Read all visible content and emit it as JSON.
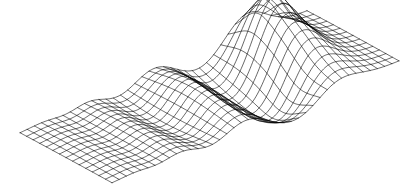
{
  "figure": {
    "title": "",
    "background_color": "#ffffff",
    "width": 417,
    "height": 194
  },
  "chart_data": {
    "type": "surface",
    "render_style": "wireframe-mesh",
    "title": "",
    "subtitle": "",
    "xlabel": "",
    "ylabel": "",
    "zlabel": "",
    "legend": [],
    "annotations": [],
    "grid": true,
    "axes_visible": false,
    "tick_labels": [],
    "line_color": "#000000",
    "line_width": 0.6,
    "face_color": "none",
    "projection": {
      "kind": "oblique-parallel",
      "corners_px": {
        "west": [
          20,
          133
        ],
        "north": [
          307,
          11
        ],
        "east": [
          397,
          62
        ],
        "south": [
          112,
          183
        ]
      },
      "u_axis_px": [
        287,
        -122
      ],
      "v_axis_px": [
        92,
        50
      ],
      "z_scale_px": 46
    },
    "mesh": {
      "nu": 40,
      "nv": 14,
      "u_range": [
        0,
        1
      ],
      "v_range": [
        0,
        1
      ]
    },
    "surface_function": {
      "description": "Damped travelling ripple along u with a localized peak near the far right and a long trough through the centre",
      "terms": [
        {
          "kind": "gaussian_ridge",
          "amp": 0.95,
          "u0": 0.78,
          "v0": 0.42,
          "su": 0.075,
          "sv": 0.34
        },
        {
          "kind": "gaussian_ridge",
          "amp": -0.72,
          "u0": 0.62,
          "v0": 0.5,
          "su": 0.085,
          "sv": 0.4
        },
        {
          "kind": "gaussian_ridge",
          "amp": 0.55,
          "u0": 0.47,
          "v0": 0.47,
          "su": 0.075,
          "sv": 0.4
        },
        {
          "kind": "gaussian_ridge",
          "amp": -0.4,
          "u0": 0.345,
          "v0": 0.47,
          "su": 0.07,
          "sv": 0.42
        },
        {
          "kind": "gaussian_ridge",
          "amp": 0.26,
          "u0": 0.245,
          "v0": 0.47,
          "su": 0.062,
          "sv": 0.44
        },
        {
          "kind": "gaussian_ridge",
          "amp": -0.15,
          "u0": 0.165,
          "v0": 0.47,
          "su": 0.055,
          "sv": 0.46
        },
        {
          "kind": "gaussian_ridge",
          "amp": 0.08,
          "u0": 0.1,
          "v0": 0.47,
          "su": 0.05,
          "sv": 0.48
        },
        {
          "kind": "gaussian_bump",
          "amp": 0.45,
          "u0": 0.8,
          "v0": 0.22,
          "su": 0.055,
          "sv": 0.13
        },
        {
          "kind": "gaussian_bump",
          "amp": -0.3,
          "u0": 0.7,
          "v0": 0.75,
          "su": 0.06,
          "sv": 0.16
        }
      ]
    },
    "z_range": [
      -0.75,
      1.05
    ]
  }
}
